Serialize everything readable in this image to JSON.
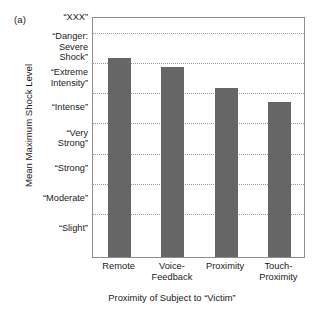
{
  "figure": {
    "panel_label": "(a)",
    "axis_color": "#8e8e8e",
    "grid_color": "#9a9a9a",
    "bar_color": "#666666",
    "background": "#ffffff"
  },
  "chart_data": {
    "type": "bar",
    "title": "",
    "subtitle": "",
    "xlabel": "Proximity of Subject to “Victim”",
    "ylabel": "Mean Maximum Shock Level",
    "categories": [
      "Remote",
      "Voice-\nFeedback",
      "Proximity",
      "Touch-\nProximity"
    ],
    "category_labels_flat": [
      "Remote",
      "Voice-Feedback",
      "Proximity",
      "Touch-Proximity"
    ],
    "values": [
      6.6,
      6.3,
      5.6,
      5.15
    ],
    "value_labels": [
      "",
      "",
      "",
      ""
    ],
    "ylim": [
      0,
      8
    ],
    "ytick_values": [
      1,
      2,
      3,
      4,
      5,
      6,
      7,
      8
    ],
    "ytick_labels": [
      "“Slight”",
      "“Moderate”",
      "“Strong”",
      "“Very\nStrong”",
      "“Intense”",
      "“Extreme\nIntensity”",
      "“Danger:\nSevere\nShock”",
      "“XXX”"
    ],
    "grid": "horizontal-dotted",
    "grid_values": [
      1.5,
      2.5,
      3.5,
      4.5,
      5.5,
      6.5,
      7.5
    ],
    "legend": null,
    "legend_position": "none",
    "series": [
      {
        "name": "Mean Maximum Shock Level",
        "values": [
          6.6,
          6.3,
          5.6,
          5.15
        ]
      }
    ]
  }
}
